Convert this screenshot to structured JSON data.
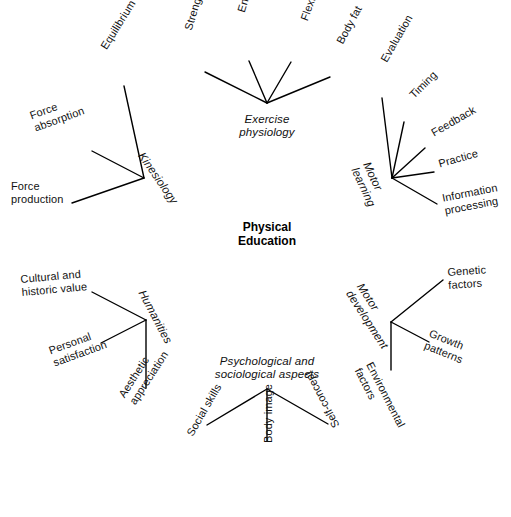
{
  "diagram": {
    "type": "concept-map",
    "center": {
      "title": "Physical\nEducation",
      "x": 267,
      "y": 232
    },
    "branches": [
      {
        "id": "kinesiology",
        "hub_label": "Kinesiology",
        "hub_x": 144,
        "hub_y": 178,
        "hub_label_x": 146,
        "hub_label_y": 150,
        "hub_rotation": 55,
        "hub_italic": true,
        "leaves": [
          {
            "label": "Equilibrium",
            "x1": 144,
            "y1": 178,
            "x2": 124,
            "y2": 86,
            "label_x": 98,
            "label_y": 45,
            "rotation": -58,
            "lines": 1
          },
          {
            "label": "Force\nabsorption",
            "x1": 144,
            "y1": 178,
            "x2": 92,
            "y2": 151,
            "label_x": 28,
            "label_y": 110,
            "rotation": -20,
            "lines": 2
          },
          {
            "label": "Force\nproduction",
            "x1": 144,
            "y1": 178,
            "x2": 72,
            "y2": 203,
            "label_x": 11,
            "label_y": 180,
            "rotation": 0,
            "lines": 2
          }
        ]
      },
      {
        "id": "exercise-physiology",
        "hub_label": "Exercise\nphysiology",
        "hub_x": 267,
        "hub_y": 103,
        "hub_label_x": 267,
        "hub_label_y": 113,
        "hub_rotation": 0,
        "hub_italic": true,
        "leaves": [
          {
            "label": "Strength",
            "x1": 267,
            "y1": 103,
            "x2": 205,
            "y2": 72,
            "label_x": 182,
            "label_y": 28,
            "rotation": -73,
            "lines": 1
          },
          {
            "label": "Endurance",
            "x1": 267,
            "y1": 103,
            "x2": 249,
            "y2": 61,
            "label_x": 235,
            "label_y": 10,
            "rotation": -73,
            "lines": 1
          },
          {
            "label": "Flexibility",
            "x1": 267,
            "y1": 103,
            "x2": 291,
            "y2": 62,
            "label_x": 298,
            "label_y": 18,
            "rotation": -70,
            "lines": 1
          },
          {
            "label": "Body fat",
            "x1": 267,
            "y1": 103,
            "x2": 330,
            "y2": 77,
            "label_x": 334,
            "label_y": 40,
            "rotation": -62,
            "lines": 1
          }
        ]
      },
      {
        "id": "motor-learning",
        "hub_label": "Motor\nlearning",
        "hub_x": 392,
        "hub_y": 178,
        "hub_label_x": 372,
        "hub_label_y": 160,
        "hub_rotation": 65,
        "hub_italic": true,
        "leaves": [
          {
            "label": "Evaluation",
            "x1": 392,
            "y1": 178,
            "x2": 382,
            "y2": 98,
            "label_x": 378,
            "label_y": 58,
            "rotation": -60,
            "lines": 1
          },
          {
            "label": "Timing",
            "x1": 392,
            "y1": 178,
            "x2": 404,
            "y2": 122,
            "label_x": 407,
            "label_y": 92,
            "rotation": -45,
            "lines": 1
          },
          {
            "label": "Feedback",
            "x1": 392,
            "y1": 178,
            "x2": 425,
            "y2": 148,
            "label_x": 429,
            "label_y": 128,
            "rotation": -30,
            "lines": 1
          },
          {
            "label": "Practice",
            "x1": 392,
            "y1": 178,
            "x2": 434,
            "y2": 172,
            "label_x": 437,
            "label_y": 158,
            "rotation": -16,
            "lines": 1
          },
          {
            "label": "Information\nprocessing",
            "x1": 392,
            "y1": 178,
            "x2": 437,
            "y2": 204,
            "label_x": 441,
            "label_y": 192,
            "rotation": -11,
            "lines": 2
          }
        ]
      },
      {
        "id": "motor-development",
        "hub_label": "Motor\ndevelopment",
        "hub_x": 391,
        "hub_y": 322,
        "hub_label_x": 365,
        "hub_label_y": 281,
        "hub_rotation": 57,
        "hub_italic": true,
        "leaves": [
          {
            "label": "Genetic\nfactors",
            "x1": 391,
            "y1": 322,
            "x2": 443,
            "y2": 280,
            "label_x": 447,
            "label_y": 266,
            "rotation": -4,
            "lines": 2
          },
          {
            "label": "Growth\npatterns",
            "x1": 391,
            "y1": 322,
            "x2": 429,
            "y2": 342,
            "label_x": 432,
            "label_y": 327,
            "rotation": 22,
            "lines": 2
          },
          {
            "label": "Environmental\nfactors",
            "x1": 391,
            "y1": 322,
            "x2": 391,
            "y2": 370,
            "label_x": 375,
            "label_y": 360,
            "rotation": 63,
            "lines": 2
          }
        ]
      },
      {
        "id": "psychological-sociological",
        "hub_label": "Psychological and\nsociological aspects",
        "hub_x": 267,
        "hub_y": 389,
        "hub_label_x": 267,
        "hub_label_y": 355,
        "hub_rotation": 0,
        "hub_italic": true,
        "leaves": [
          {
            "label": "Social skills",
            "x1": 267,
            "y1": 389,
            "x2": 207,
            "y2": 425,
            "label_x": 184,
            "label_y": 432,
            "rotation": -60,
            "lines": 1
          },
          {
            "label": "Body image",
            "x1": 267,
            "y1": 389,
            "x2": 267,
            "y2": 441,
            "label_x": 262,
            "label_y": 443,
            "rotation": -90,
            "lines": 1
          },
          {
            "label": "Self-concept",
            "x1": 267,
            "y1": 389,
            "x2": 328,
            "y2": 424,
            "label_x": 331,
            "label_y": 430,
            "rotation": -118,
            "lines": 1
          }
        ]
      },
      {
        "id": "humanities",
        "hub_label": "Humanities",
        "hub_x": 146,
        "hub_y": 320,
        "hub_label_x": 147,
        "hub_label_y": 288,
        "hub_rotation": 62,
        "hub_italic": true,
        "leaves": [
          {
            "label": "Cultural and\nhistoric value",
            "x1": 146,
            "y1": 320,
            "x2": 92,
            "y2": 292,
            "label_x": 20,
            "label_y": 273,
            "rotation": -5,
            "lines": 2
          },
          {
            "label": "Personal\nsatisfaction",
            "x1": 146,
            "y1": 320,
            "x2": 101,
            "y2": 343,
            "label_x": 47,
            "label_y": 345,
            "rotation": -20,
            "lines": 2
          },
          {
            "label": "Aesthetic\nappreciation",
            "x1": 146,
            "y1": 320,
            "x2": 146,
            "y2": 388,
            "label_x": 116,
            "label_y": 393,
            "rotation": -57,
            "lines": 2
          }
        ]
      }
    ]
  }
}
